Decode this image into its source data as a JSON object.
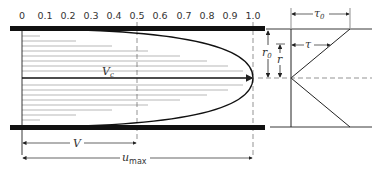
{
  "figure": {
    "type": "laminar pipe flow velocity profile and shear stress distribution",
    "scale_ticks": [
      "0",
      "0.1",
      "0.2",
      "0.3",
      "0.4",
      "0.5",
      "0.6",
      "0.7",
      "0.8",
      "0.9",
      "1.0"
    ],
    "labels": {
      "centerline_velocity": "V",
      "centerline_velocity_sub": "c",
      "mean_velocity": "V",
      "max_velocity": "u",
      "max_velocity_sub": "max",
      "pipe_radius": "r",
      "pipe_radius_sub": "0",
      "radius": "r",
      "wall_shear": "τ",
      "wall_shear_sub": "0",
      "shear": "τ"
    },
    "profile": {
      "shape": "parabolic",
      "max_fraction": 1.0,
      "mean_fraction": 0.5,
      "dashed_markers_at": [
        0.5,
        1.0
      ]
    },
    "shear_diagram": {
      "shape": "linear",
      "value_at_center": 0,
      "value_at_wall": "τ0"
    }
  }
}
